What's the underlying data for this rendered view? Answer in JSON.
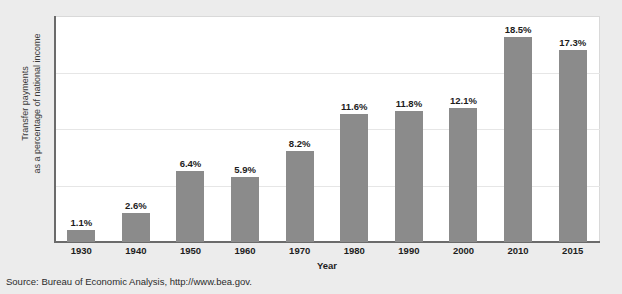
{
  "figure": {
    "source_note": "Source: Bureau of Economic Analysis, http://www.bea.gov.",
    "title_remnant": ""
  },
  "colors": {
    "bar_fill": "#8b8b8b",
    "panel_background": "#ffffff",
    "page_background": "#ececec",
    "axis_line": "#6b6b6b",
    "gridline": "#e6e6e6",
    "label_text": "#1d1d1d"
  },
  "chart_data": {
    "type": "bar",
    "title": "",
    "xlabel": "Year",
    "ylabel_line1": "Transfer payments",
    "ylabel_line2": "as a percentage of national income",
    "categories": [
      "1930",
      "1940",
      "1950",
      "1960",
      "1970",
      "1980",
      "1990",
      "2000",
      "2010",
      "2015"
    ],
    "values": [
      1.1,
      2.6,
      6.4,
      5.9,
      8.2,
      11.6,
      11.8,
      12.1,
      18.5,
      17.3
    ],
    "data_labels": [
      "1.1%",
      "2.6%",
      "6.4%",
      "5.9%",
      "8.2%",
      "11.6%",
      "11.8%",
      "12.1%",
      "18.5%",
      "17.3%"
    ],
    "ylim": [
      0,
      20.4
    ],
    "yticks_labeled": [],
    "gridlines_at": [
      5.1,
      10.2,
      15.3
    ],
    "grid": true,
    "legend": "none"
  }
}
